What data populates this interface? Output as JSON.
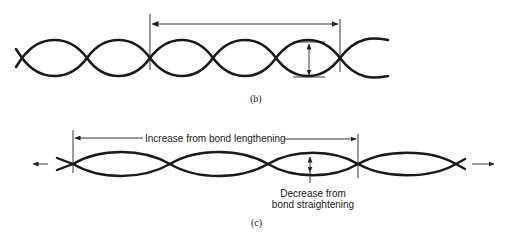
{
  "figure": {
    "panel_b": {
      "caption": "(b)"
    },
    "panel_c": {
      "caption": "(c)",
      "increase_label": "Increase from bond lengthening",
      "decrease_label_line1": "Decrease from",
      "decrease_label_line2": "bond straightening"
    }
  }
}
